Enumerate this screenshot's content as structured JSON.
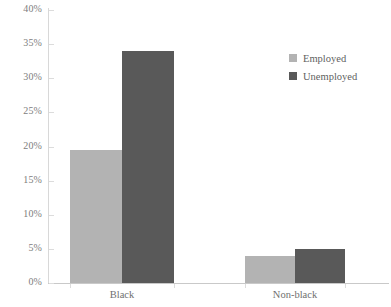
{
  "chart_data": {
    "type": "bar",
    "title": "",
    "xlabel": "",
    "ylabel": "",
    "categories": [
      "Black",
      "Non-black"
    ],
    "series": [
      {
        "name": "Employed",
        "values": [
          19.5,
          4.0
        ],
        "color": "#b3b3b3"
      },
      {
        "name": "Unemployed",
        "values": [
          34.0,
          5.0
        ],
        "color": "#595959"
      }
    ],
    "ylim": [
      0,
      40
    ],
    "ytick_values": [
      0,
      5,
      10,
      15,
      20,
      25,
      30,
      35,
      40
    ],
    "ytick_labels": [
      "0%",
      "5%",
      "10%",
      "15%",
      "20%",
      "25%",
      "30%",
      "35%",
      "40%"
    ],
    "value_format": "percent",
    "grid": false,
    "legend_position": "top-right"
  },
  "legend": {
    "items": [
      {
        "label": "Employed",
        "color": "#b3b3b3"
      },
      {
        "label": "Unemployed",
        "color": "#595959"
      }
    ]
  },
  "axis": {
    "y_labels": [
      "40%",
      "35%",
      "30%",
      "25%",
      "20%",
      "15%",
      "10%",
      "5%",
      "0%"
    ],
    "x_labels": [
      "Black",
      "Non-black"
    ]
  },
  "colors": {
    "employed": "#b3b3b3",
    "unemployed": "#595959",
    "axis": "#c9c9c9",
    "tick_text": "#7d7d7d",
    "background": "#ffffff"
  }
}
